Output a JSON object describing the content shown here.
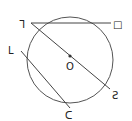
{
  "diagram": {
    "type": "circle-geometry",
    "circle": {
      "cx": 70,
      "cy": 60,
      "r": 43,
      "stroke": "#555555"
    },
    "center_label": "O",
    "points": [
      {
        "id": "p1",
        "label": "ᒣ",
        "x": 31,
        "y": 23,
        "lx": 20,
        "ly": 27
      },
      {
        "id": "p2",
        "label": "□",
        "x": 111,
        "y": 23,
        "lx": 114,
        "ly": 27
      },
      {
        "id": "p3",
        "label": "ᒪ",
        "x": 21,
        "y": 51,
        "lx": 9,
        "ly": 52
      },
      {
        "id": "p4",
        "label": "Ƨ",
        "x": 110,
        "y": 89,
        "lx": 113,
        "ly": 99
      },
      {
        "id": "p5",
        "label": "ᑕ",
        "x": 70,
        "y": 108,
        "lx": 66,
        "ly": 119
      }
    ],
    "segments": [
      {
        "from": "p1",
        "to": "p2",
        "name": "chord-top"
      },
      {
        "from": "p1",
        "to": "p4",
        "name": "diameter"
      },
      {
        "from": "p3",
        "to": "p5",
        "name": "chord-lower"
      }
    ]
  }
}
